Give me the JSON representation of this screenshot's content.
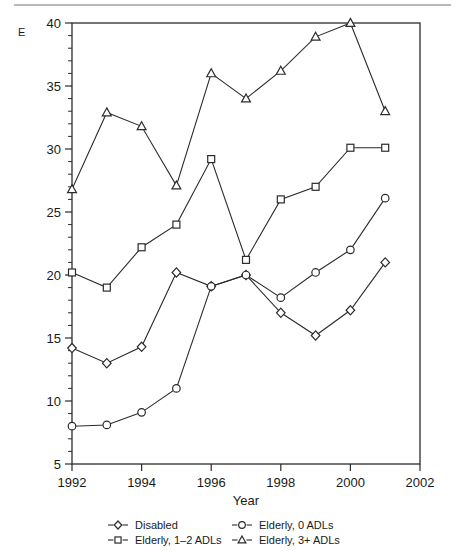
{
  "chart_data": {
    "type": "line",
    "title": "",
    "subtitle": "",
    "xlabel": "Year",
    "ylabel": "E",
    "x": [
      1992,
      1993,
      1994,
      1995,
      1996,
      1997,
      1998,
      1999,
      2000,
      2001
    ],
    "xlim": [
      1992,
      2002
    ],
    "ylim": [
      5,
      40
    ],
    "xticks": [
      1992,
      1994,
      1996,
      1998,
      2000,
      2002
    ],
    "xticklabels": [
      "1992",
      "1994",
      "1996",
      "1998",
      "2000",
      "2002"
    ],
    "yticks": [
      5,
      10,
      15,
      20,
      25,
      30,
      35,
      40
    ],
    "yticklabels": [
      "5",
      "10",
      "15",
      "20",
      "25",
      "30",
      "35",
      "40"
    ],
    "minor_tick_step": 1,
    "grid": false,
    "legend_position": "below-axis",
    "legend_columns": 2,
    "series": [
      {
        "name": "Disabled",
        "marker": "diamond",
        "values": [
          14.2,
          13.0,
          14.3,
          20.2,
          19.1,
          20.0,
          17.0,
          15.2,
          17.2,
          21.0
        ]
      },
      {
        "name": "Elderly, 1–2 ADLs",
        "marker": "square",
        "values": [
          20.2,
          19.0,
          22.2,
          24.0,
          29.2,
          21.2,
          26.0,
          27.0,
          30.1,
          30.1
        ]
      },
      {
        "name": "Elderly, 0 ADLs",
        "marker": "circle",
        "values": [
          8.0,
          8.1,
          9.1,
          11.0,
          19.1,
          20.0,
          18.2,
          20.2,
          22.0,
          26.1
        ]
      },
      {
        "name": "Elderly, 3+ ADLs",
        "marker": "triangle",
        "values": [
          26.8,
          32.9,
          31.8,
          27.1,
          36.0,
          34.0,
          36.2,
          38.9,
          40.0,
          33.0
        ]
      }
    ]
  },
  "legend": {
    "entries": [
      {
        "label": "Disabled",
        "marker": "diamond"
      },
      {
        "label": "Elderly, 0 ADLs",
        "marker": "circle"
      },
      {
        "label": "Elderly, 1–2 ADLs",
        "marker": "square"
      },
      {
        "label": "Elderly, 3+ ADLs",
        "marker": "triangle"
      }
    ]
  },
  "colors": {
    "ink": "#2b2b2b",
    "marker_fill": "#ffffff",
    "rule": "#b9b9b9"
  }
}
